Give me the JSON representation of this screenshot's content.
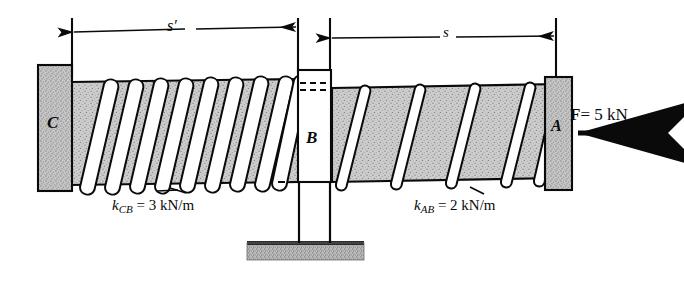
{
  "figure": {
    "type": "mechanics-free-body-diagram"
  },
  "dimensions": {
    "left_span_label": "s′",
    "right_span_label": "s"
  },
  "bodies": {
    "wall_c_label": "C",
    "post_b_label": "B",
    "block_a_label": "A"
  },
  "force": {
    "symbol": "F",
    "equals": "=",
    "magnitude": "5",
    "unit": "kN",
    "direction": "leftward",
    "full_text": "F = 5 kN"
  },
  "springs": [
    {
      "name": "spring-cb",
      "symbol": "k",
      "subscript": "CB",
      "equals": "=",
      "value": "3",
      "unit": "kN/m",
      "full_text": "k_CB = 3 kN/m",
      "coils": 9
    },
    {
      "name": "spring-ab",
      "symbol": "k",
      "subscript": "AB",
      "equals": "=",
      "value": "2",
      "unit": "kN/m",
      "full_text": "k_AB = 2 kN/m",
      "coils": 5
    }
  ],
  "colors": {
    "ink": "#0a0a0a",
    "body_fill": "#c9c9c9",
    "block_fill": "#c4c4c4",
    "ground_fill": "#b8b8b8",
    "coil_fill": "#ffffff",
    "paper": "#ffffff"
  }
}
